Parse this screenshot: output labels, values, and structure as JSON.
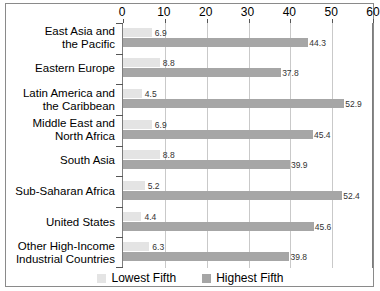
{
  "chart_data": {
    "type": "bar",
    "orientation": "horizontal",
    "title": "",
    "xlabel": "",
    "ylabel": "",
    "xlim": [
      0,
      60
    ],
    "xticks": [
      0,
      10,
      20,
      30,
      40,
      50,
      60
    ],
    "xtick_labels": [
      "0",
      "10",
      "20",
      "30",
      "40",
      "50",
      "60"
    ],
    "grid": true,
    "grid_axis": "x",
    "legend_position": "bottom-center",
    "categories": [
      "East Asia and the Pacific",
      "Eastern Europe",
      "Latin America and the Caribbean",
      "Middle East and North Africa",
      "South Asia",
      "Sub-Saharan Africa",
      "United States",
      "Other High-Income Industrial Countries"
    ],
    "category_lines": [
      [
        "East Asia and",
        "the Pacific"
      ],
      [
        "Eastern Europe"
      ],
      [
        "Latin America and",
        "the Caribbean"
      ],
      [
        "Middle East and",
        "North Africa"
      ],
      [
        "South Asia"
      ],
      [
        "Sub-Saharan Africa"
      ],
      [
        "United States"
      ],
      [
        "Other High-Income",
        "Industrial Countries"
      ]
    ],
    "series": [
      {
        "name": "Lowest Fifth",
        "color": "#e4e4e4",
        "values": [
          6.9,
          8.8,
          4.5,
          6.9,
          8.8,
          5.2,
          4.4,
          6.3
        ],
        "labels": [
          "6.9",
          "8.8",
          "4.5",
          "6.9",
          "8.8",
          "5.2",
          "4.4",
          "6.3"
        ]
      },
      {
        "name": "Highest Fifth",
        "color": "#a6a6a6",
        "values": [
          44.3,
          37.8,
          52.9,
          45.4,
          39.9,
          52.4,
          45.6,
          39.8
        ],
        "labels": [
          "44.3",
          "37.8",
          "52.9",
          "45.4",
          "39.9",
          "52.4",
          "45.6",
          "39.8"
        ]
      }
    ]
  },
  "legend": {
    "items": [
      {
        "label": "Lowest Fifth",
        "color": "#e4e4e4"
      },
      {
        "label": "Highest Fifth",
        "color": "#a6a6a6"
      }
    ]
  },
  "colors": {
    "lowest_fifth": "#e4e4e4",
    "highest_fifth": "#a6a6a6",
    "gridline": "#c9c9c9",
    "border": "#8a8a8a",
    "text": "#000000"
  }
}
